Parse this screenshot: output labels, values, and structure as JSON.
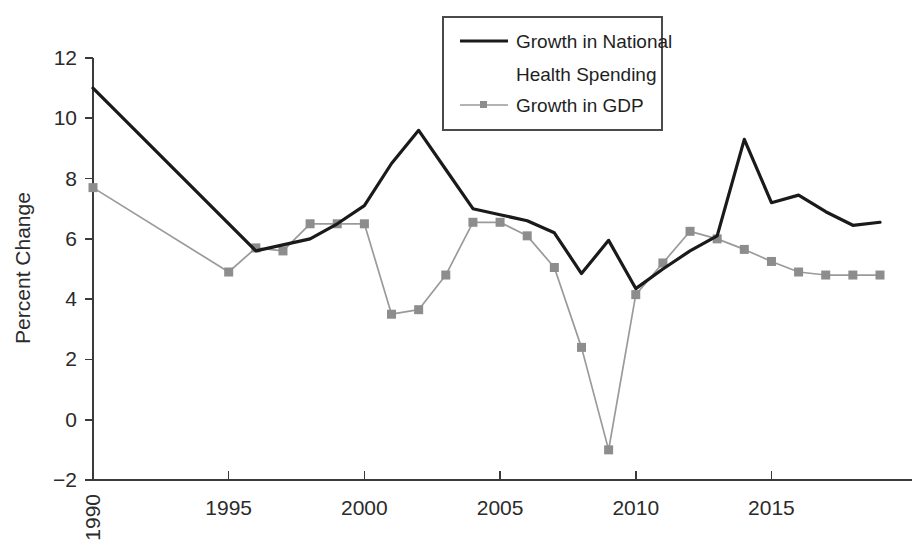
{
  "chart_data": {
    "type": "line",
    "title": "",
    "xlabel": "",
    "ylabel": "Percent Change",
    "xlim": [
      1990,
      2019
    ],
    "ylim": [
      -2,
      12
    ],
    "grid": false,
    "legend_position": "top-center",
    "y_ticks": [
      -2,
      0,
      2,
      4,
      6,
      8,
      10,
      12
    ],
    "y_tick_labels": [
      "−2",
      "0",
      "2",
      "4",
      "6",
      "8",
      "10",
      "12"
    ],
    "x_ticks": [
      1990,
      1995,
      2000,
      2005,
      2010,
      2015
    ],
    "x_tick_labels": [
      "1990",
      "1995",
      "2000",
      "2005",
      "2010",
      "2015"
    ],
    "x_tick_label_rotated": [
      "1990"
    ],
    "x": [
      1990,
      1991,
      1992,
      1993,
      1994,
      1995,
      1996,
      1997,
      1998,
      1999,
      2000,
      2001,
      2002,
      2003,
      2004,
      2005,
      2006,
      2007,
      2008,
      2009,
      2010,
      2011,
      2012,
      2013,
      2014,
      2015,
      2016,
      2017,
      2018,
      2019
    ],
    "series": [
      {
        "name": "Growth in National Health Spending",
        "color": "#1a1a1a",
        "marker": "none",
        "x": [
          1990,
          1996,
          1997,
          1998,
          1999,
          2000,
          2001,
          2002,
          2003,
          2004,
          2005,
          2006,
          2007,
          2008,
          2009,
          2010,
          2011,
          2012,
          2013,
          2014,
          2015,
          2016,
          2017,
          2018,
          2019
        ],
        "values": [
          11.0,
          5.6,
          5.8,
          6.0,
          6.5,
          7.1,
          8.5,
          9.6,
          8.3,
          7.0,
          6.8,
          6.6,
          6.2,
          4.85,
          5.95,
          4.35,
          5.0,
          5.6,
          6.1,
          9.3,
          7.2,
          7.45,
          6.9,
          6.45,
          6.55
        ]
      },
      {
        "name": "Growth in GDP",
        "color": "#8d8d8d",
        "marker": "square",
        "x": [
          1990,
          1995,
          1996,
          1997,
          1998,
          1999,
          2000,
          2001,
          2002,
          2003,
          2004,
          2005,
          2006,
          2007,
          2008,
          2009,
          2010,
          2011,
          2012,
          2013,
          2014,
          2015,
          2016,
          2017,
          2018,
          2019
        ],
        "values": [
          7.7,
          4.9,
          5.7,
          5.6,
          6.5,
          6.5,
          6.5,
          3.5,
          3.65,
          4.8,
          6.55,
          6.55,
          6.1,
          5.05,
          2.4,
          -1.0,
          4.15,
          5.2,
          6.25,
          6.0,
          5.65,
          5.25,
          4.9,
          4.8,
          4.8,
          4.8
        ]
      }
    ]
  },
  "legend": {
    "entries": [
      {
        "label_line1": "Growth in National",
        "label_line2": "Health Spending"
      },
      {
        "label_line1": "Growth in GDP",
        "label_line2": ""
      }
    ]
  },
  "axes": {
    "y_title": "Percent Change"
  }
}
